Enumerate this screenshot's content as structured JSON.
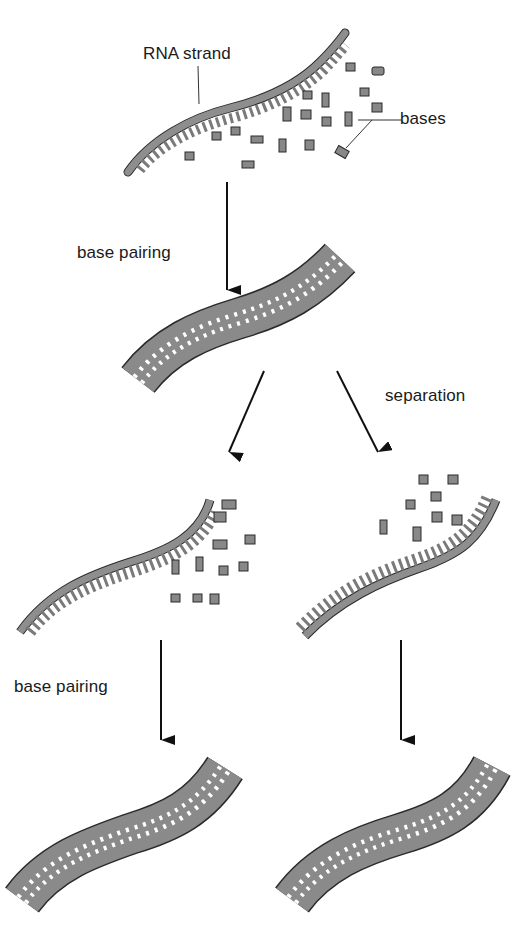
{
  "diagram": {
    "colors": {
      "strand_fill": "#8e8e8e",
      "strand_dark": "#6f6f6f",
      "outline": "#2a2a2a",
      "rung": "#ffffff",
      "arrow": "#111111",
      "background": "#ffffff"
    },
    "labels": {
      "rna_strand": "RNA strand",
      "bases": "bases",
      "base_pairing_1": "base pairing",
      "separation": "separation",
      "base_pairing_2": "base pairing"
    },
    "stages": [
      {
        "id": "single-strand-with-free-bases",
        "description": "single RNA strand with free bases"
      },
      {
        "id": "double-strand",
        "description": "base-paired double strand"
      },
      {
        "id": "separated-left",
        "description": "separated strand with free bases (left)"
      },
      {
        "id": "separated-right",
        "description": "separated strand with free bases (right)"
      },
      {
        "id": "double-strand-left",
        "description": "new double strand (left)"
      },
      {
        "id": "double-strand-right",
        "description": "new double strand (right)"
      }
    ],
    "arrows": [
      {
        "from": "single-strand-with-free-bases",
        "to": "double-strand",
        "label": "base pairing"
      },
      {
        "from": "double-strand",
        "to": "separated-left",
        "label": ""
      },
      {
        "from": "double-strand",
        "to": "separated-right",
        "label": "separation"
      },
      {
        "from": "separated-left",
        "to": "double-strand-left",
        "label": "base pairing"
      },
      {
        "from": "separated-right",
        "to": "double-strand-right",
        "label": ""
      }
    ]
  }
}
